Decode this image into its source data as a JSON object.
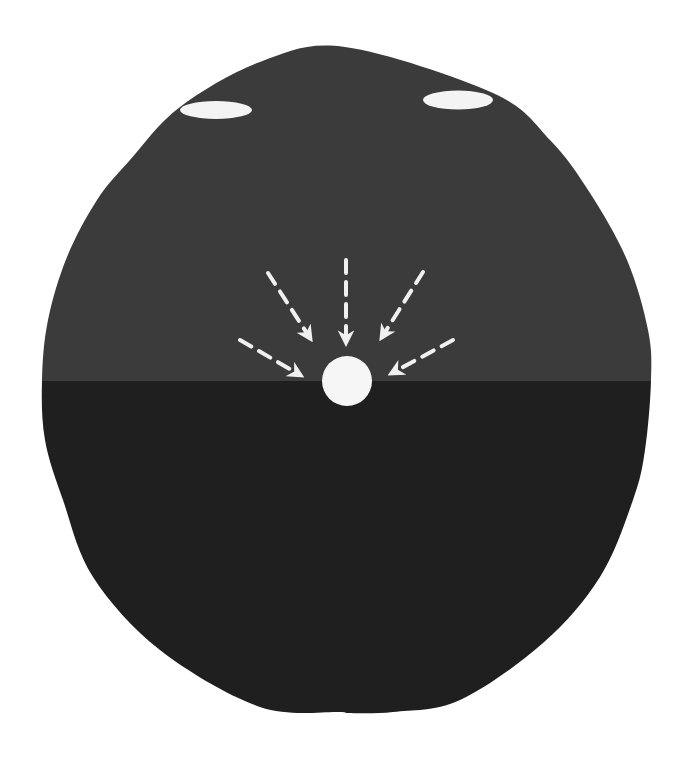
{
  "diagram": {
    "title": "",
    "background": "#ffffff",
    "body_shape": {
      "kind": "head-silhouette",
      "outline_points": [
        [
          345,
          47
        ],
        [
          493,
          93
        ],
        [
          550,
          140
        ],
        [
          590,
          193
        ],
        [
          627,
          260
        ],
        [
          648,
          330
        ],
        [
          651,
          380
        ],
        [
          645,
          450
        ],
        [
          633,
          500
        ],
        [
          600,
          577
        ],
        [
          543,
          643
        ],
        [
          460,
          700
        ],
        [
          393,
          712
        ],
        [
          345,
          713
        ],
        [
          340,
          712
        ],
        [
          260,
          707
        ],
        [
          160,
          650
        ],
        [
          93,
          577
        ],
        [
          63,
          500
        ],
        [
          45,
          440
        ],
        [
          42,
          380
        ],
        [
          48,
          320
        ],
        [
          67,
          257
        ],
        [
          97,
          200
        ],
        [
          130,
          160
        ],
        [
          180,
          107
        ],
        [
          260,
          62
        ]
      ],
      "upper_region_color": "#3b3b3b",
      "lower_region_color": "#1f1f1f",
      "divider_y": 381
    },
    "ellipses": [
      {
        "name": "left-oval",
        "cx": 216,
        "cy": 110,
        "rx": 36,
        "ry": 9,
        "color": "#f4f4f4"
      },
      {
        "name": "right-oval",
        "cx": 458,
        "cy": 100,
        "rx": 35,
        "ry": 9.5,
        "color": "#f4f4f4"
      }
    ],
    "focal_point": {
      "cx": 347,
      "cy": 381,
      "r": 25,
      "color": "#f6f6f6"
    },
    "arrows": [
      {
        "name": "arrow-center",
        "x1": 346,
        "y1": 260,
        "x2": 346,
        "y2": 342
      },
      {
        "name": "arrow-upper-left",
        "x1": 268,
        "y1": 273,
        "x2": 310,
        "y2": 338
      },
      {
        "name": "arrow-upper-right",
        "x1": 423,
        "y1": 272,
        "x2": 382,
        "y2": 337
      },
      {
        "name": "arrow-lower-left",
        "x1": 240,
        "y1": 340,
        "x2": 300,
        "y2": 375
      },
      {
        "name": "arrow-lower-right",
        "x1": 453,
        "y1": 340,
        "x2": 392,
        "y2": 373
      }
    ],
    "arrow_color": "#f0f0f0",
    "caption": "Dashed arrows converging on a central point"
  }
}
